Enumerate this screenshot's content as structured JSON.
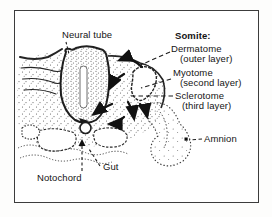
{
  "figure": {
    "ink": "#1c1c1c",
    "background": "#ffffff",
    "labels": {
      "neural_tube": "Neural tube",
      "somite_heading": "Somite:",
      "dermatome": "Dermatome",
      "dermatome_sub": "(outer layer)",
      "myotome": "Myotome",
      "myotome_sub": "(second layer)",
      "sclerotome": "Sclerotome",
      "sclerotome_sub": "(third layer)",
      "amnion": "Amnion",
      "gut": "Gut",
      "notochord": "Notochord"
    }
  }
}
